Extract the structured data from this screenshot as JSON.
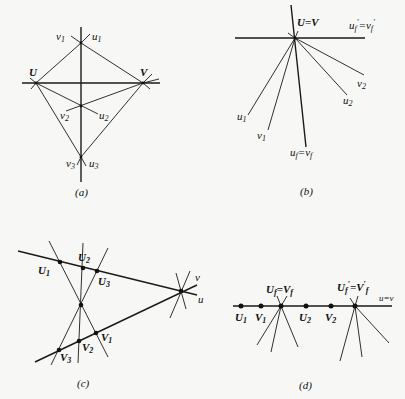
{
  "panels": {
    "a": {
      "caption": "(a)",
      "labels": {
        "U": "U",
        "V": "V",
        "v1": "v",
        "v1_sub": "1",
        "u1": "u",
        "u1_sub": "1",
        "v2": "v",
        "v2_sub": "2",
        "u2": "u",
        "u2_sub": "2",
        "v3": "v",
        "v3_sub": "3",
        "u3": "u",
        "u3_sub": "3"
      }
    },
    "b": {
      "caption": "(b)",
      "labels": {
        "UV": "U=V",
        "ufp": "u",
        "ufp_sub": "f",
        "ufp_prime": "′",
        "ufp_eq": "=v",
        "vfp_sub": "f",
        "vfp_prime": "′",
        "u1": "u",
        "u1_sub": "1",
        "v1": "v",
        "v1_sub": "1",
        "u2": "u",
        "u2_sub": "2",
        "v2": "v",
        "v2_sub": "2",
        "uf": "u",
        "uf_sub": "f",
        "uf_eq": "=v",
        "vf_sub": "f"
      }
    },
    "c": {
      "caption": "(c)",
      "labels": {
        "U1": "U",
        "U1_sub": "1",
        "U2": "U",
        "U2_sub": "2",
        "U3": "U",
        "U3_sub": "3",
        "V1": "V",
        "V1_sub": "1",
        "V2": "V",
        "V2_sub": "2",
        "V3": "V",
        "V3_sub": "3",
        "v": "v",
        "u": "u"
      }
    },
    "d": {
      "caption": "(d)",
      "labels": {
        "U1": "U",
        "U1_sub": "1",
        "V1": "V",
        "V1_sub": "1",
        "U2": "U",
        "U2_sub": "2",
        "V2": "V",
        "V2_sub": "2",
        "Uf": "U",
        "Uf_sub": "f",
        "Uf_eq": "=V",
        "Vf_sub": "f",
        "Ufp": "U",
        "Ufp_sub": "f",
        "Ufp_prime": "′",
        "Ufp_eq": "=V",
        "Vfp_prime": "′",
        "Vfp_sub": "f",
        "uv": "u=v"
      }
    }
  }
}
